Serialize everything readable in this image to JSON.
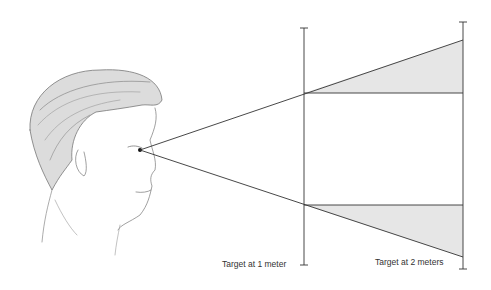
{
  "diagram": {
    "eye_point": [
      140,
      150
    ],
    "targets": [
      {
        "label": "Target at 1 meter",
        "x": 304,
        "top": 28,
        "bottom": 265,
        "ray_upper_y": 93,
        "ray_lower_y": 205
      },
      {
        "label": "Target at 2 meters",
        "x": 463,
        "top": 22,
        "bottom": 269,
        "ray_upper_y": 40,
        "ray_lower_y": 257
      }
    ],
    "fill_color": "#e6e6e6",
    "line_color": "#333333"
  }
}
